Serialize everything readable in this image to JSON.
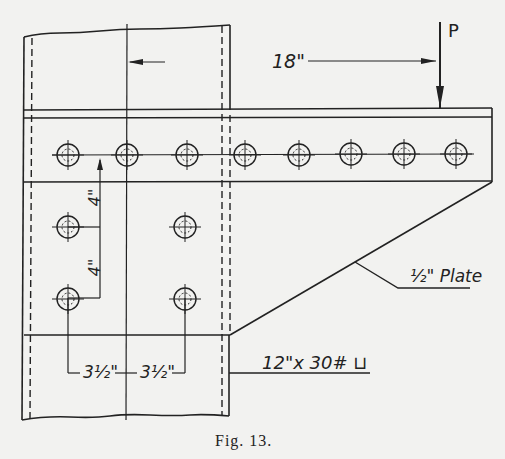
{
  "figure": {
    "caption": "Fig. 13.",
    "type": "bracket connection drawing",
    "load_label": "P",
    "dimensions": {
      "load_offset": "18\"",
      "vertical_spacing_top": "4\"",
      "vertical_spacing_bottom": "4\"",
      "horizontal_spacing_left": "3½\"",
      "horizontal_spacing_right": "3½\""
    },
    "callouts": {
      "plate": "½\" Plate",
      "channel": "12\"x 30# ⊔"
    },
    "bolts": {
      "top_row_count": 8,
      "lower_rows": 2,
      "lower_row_count": 2
    }
  }
}
